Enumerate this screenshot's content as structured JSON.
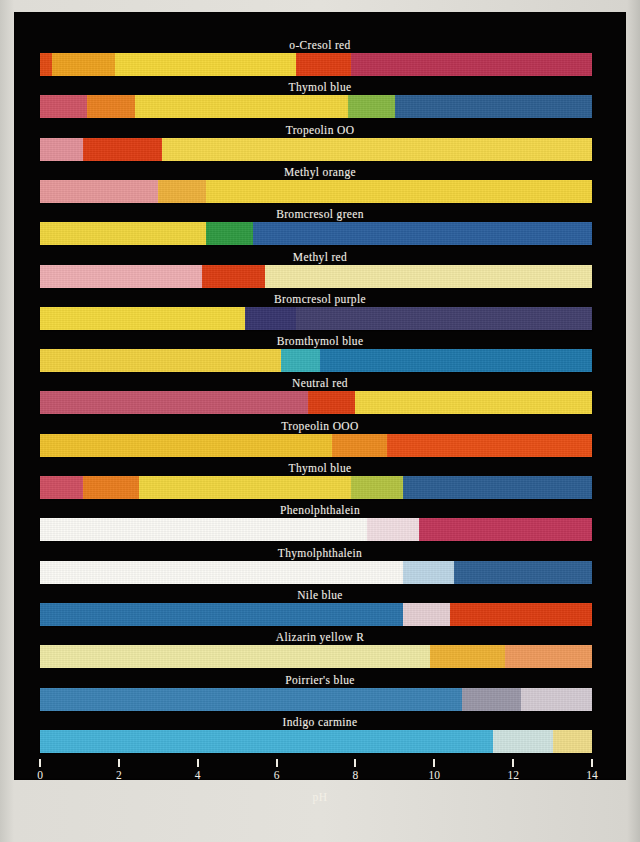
{
  "chart_data": {
    "type": "bar",
    "title": "",
    "xlabel": "pH",
    "ylabel": "",
    "xlim": [
      0,
      14
    ],
    "x_ticks": [
      0,
      2,
      4,
      6,
      8,
      10,
      12,
      14
    ],
    "x_tick_labels": [
      "0",
      "2",
      "4",
      "6",
      "8",
      "10",
      "12",
      "14"
    ],
    "grid": false,
    "legend": "none",
    "background": "#050404",
    "text_color": "#f2efe6",
    "indicators": [
      {
        "name": "o-Cresol red",
        "segments": [
          {
            "from": 0.0,
            "to": 0.3,
            "color": "#e24a12"
          },
          {
            "from": 0.3,
            "to": 1.9,
            "color": "#eda21f"
          },
          {
            "from": 1.9,
            "to": 6.5,
            "color": "#f4d738"
          },
          {
            "from": 6.5,
            "to": 7.9,
            "color": "#df3d12"
          },
          {
            "from": 7.9,
            "to": 14.0,
            "color": "#ba3353"
          }
        ]
      },
      {
        "name": "Thymol blue",
        "segments": [
          {
            "from": 0.0,
            "to": 1.2,
            "color": "#cf5466"
          },
          {
            "from": 1.2,
            "to": 2.4,
            "color": "#ea8120"
          },
          {
            "from": 2.4,
            "to": 7.8,
            "color": "#f2d63c"
          },
          {
            "from": 7.8,
            "to": 9.0,
            "color": "#87b843"
          },
          {
            "from": 9.0,
            "to": 14.0,
            "color": "#2e5f91"
          }
        ]
      },
      {
        "name": "Tropeolin OO",
        "segments": [
          {
            "from": 0.0,
            "to": 1.1,
            "color": "#e2919a"
          },
          {
            "from": 1.1,
            "to": 3.1,
            "color": "#de3c13"
          },
          {
            "from": 3.1,
            "to": 14.0,
            "color": "#f4d84a"
          }
        ]
      },
      {
        "name": "Methyl orange",
        "segments": [
          {
            "from": 0.0,
            "to": 3.0,
            "color": "#e6989a"
          },
          {
            "from": 3.0,
            "to": 4.2,
            "color": "#eeb13b"
          },
          {
            "from": 4.2,
            "to": 14.0,
            "color": "#f3d53c"
          }
        ]
      },
      {
        "name": "Bromcresol green",
        "segments": [
          {
            "from": 0.0,
            "to": 4.2,
            "color": "#f0d63d"
          },
          {
            "from": 4.2,
            "to": 5.4,
            "color": "#2f9a41"
          },
          {
            "from": 5.4,
            "to": 14.0,
            "color": "#2b5f9d"
          }
        ]
      },
      {
        "name": "Methyl red",
        "segments": [
          {
            "from": 0.0,
            "to": 4.1,
            "color": "#eeaeb2"
          },
          {
            "from": 4.1,
            "to": 5.7,
            "color": "#dd3c12"
          },
          {
            "from": 5.7,
            "to": 14.0,
            "color": "#f2e8a5"
          }
        ]
      },
      {
        "name": "Bromcresol purple",
        "segments": [
          {
            "from": 0.0,
            "to": 5.2,
            "color": "#f3d93c"
          },
          {
            "from": 5.2,
            "to": 6.5,
            "color": "#37356e"
          },
          {
            "from": 6.5,
            "to": 14.0,
            "color": "#423f6d"
          }
        ]
      },
      {
        "name": "Bromthymol blue",
        "segments": [
          {
            "from": 0.0,
            "to": 6.1,
            "color": "#f0d13f"
          },
          {
            "from": 6.1,
            "to": 7.1,
            "color": "#38b0b7"
          },
          {
            "from": 7.1,
            "to": 14.0,
            "color": "#1f78ab"
          }
        ]
      },
      {
        "name": "Neutral red",
        "segments": [
          {
            "from": 0.0,
            "to": 6.8,
            "color": "#c4566d"
          },
          {
            "from": 6.8,
            "to": 8.0,
            "color": "#dd3d12"
          },
          {
            "from": 8.0,
            "to": 14.0,
            "color": "#f3d73f"
          }
        ]
      },
      {
        "name": "Tropeolin OOO",
        "segments": [
          {
            "from": 0.0,
            "to": 7.4,
            "color": "#efc22c"
          },
          {
            "from": 7.4,
            "to": 8.8,
            "color": "#ec8b1f"
          },
          {
            "from": 8.8,
            "to": 14.0,
            "color": "#e84f15"
          }
        ]
      },
      {
        "name": "Thymol blue",
        "segments": [
          {
            "from": 0.0,
            "to": 1.1,
            "color": "#cf4f62"
          },
          {
            "from": 1.1,
            "to": 2.5,
            "color": "#ea7d1e"
          },
          {
            "from": 2.5,
            "to": 7.9,
            "color": "#f0d63e"
          },
          {
            "from": 7.9,
            "to": 9.2,
            "color": "#b4c441"
          },
          {
            "from": 9.2,
            "to": 14.0,
            "color": "#2d5e92"
          }
        ]
      },
      {
        "name": "Phenolphthalein",
        "segments": [
          {
            "from": 0.0,
            "to": 8.3,
            "color": "#fbfaf5"
          },
          {
            "from": 8.3,
            "to": 9.6,
            "color": "#f1dee2"
          },
          {
            "from": 9.6,
            "to": 14.0,
            "color": "#c2365a"
          }
        ]
      },
      {
        "name": "Thymolphthalein",
        "segments": [
          {
            "from": 0.0,
            "to": 9.2,
            "color": "#fbfaf5"
          },
          {
            "from": 9.2,
            "to": 10.5,
            "color": "#bcd6e6"
          },
          {
            "from": 10.5,
            "to": 14.0,
            "color": "#2f6093"
          }
        ]
      },
      {
        "name": "Nile blue",
        "segments": [
          {
            "from": 0.0,
            "to": 9.2,
            "color": "#2a73aa"
          },
          {
            "from": 9.2,
            "to": 10.4,
            "color": "#e5cfd3"
          },
          {
            "from": 10.4,
            "to": 14.0,
            "color": "#dd3c11"
          }
        ]
      },
      {
        "name": "Alizarin yellow R",
        "segments": [
          {
            "from": 0.0,
            "to": 9.9,
            "color": "#eee9a5"
          },
          {
            "from": 9.9,
            "to": 11.8,
            "color": "#eeb233"
          },
          {
            "from": 11.8,
            "to": 14.0,
            "color": "#ef9a5c"
          }
        ]
      },
      {
        "name": "Poirrier's blue",
        "segments": [
          {
            "from": 0.0,
            "to": 10.7,
            "color": "#3b82b4"
          },
          {
            "from": 10.7,
            "to": 12.2,
            "color": "#9a97a8"
          },
          {
            "from": 12.2,
            "to": 14.0,
            "color": "#d4cbd3"
          }
        ]
      },
      {
        "name": "Indigo carmine",
        "segments": [
          {
            "from": 0.0,
            "to": 11.5,
            "color": "#45b3d8"
          },
          {
            "from": 11.5,
            "to": 13.0,
            "color": "#cfe3e0"
          },
          {
            "from": 13.0,
            "to": 14.0,
            "color": "#efdd8a"
          }
        ]
      }
    ]
  }
}
